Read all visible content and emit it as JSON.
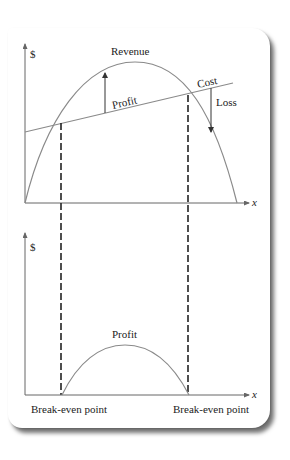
{
  "figure": {
    "top_chart": {
      "y_axis_label": "$",
      "x_axis_label": "x",
      "curves": {
        "revenue_label": "Revenue",
        "cost_label": "Cost"
      },
      "annotations": {
        "profit_label": "Profit",
        "loss_label": "Loss"
      }
    },
    "bottom_chart": {
      "y_axis_label": "$",
      "x_axis_label": "x",
      "curves": {
        "profit_label": "Profit"
      },
      "break_even_left_label": "Break-even point",
      "break_even_right_label": "Break-even point"
    },
    "colors": {
      "curve": "#8a8a8a",
      "axis": "#666666",
      "dashed_line": "#222222",
      "text": "#222222"
    }
  }
}
